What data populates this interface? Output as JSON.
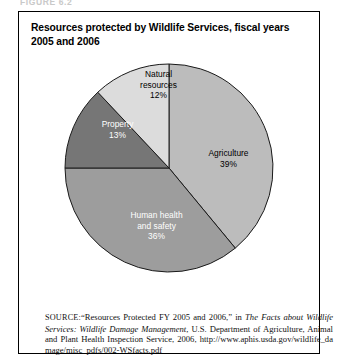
{
  "figure": {
    "number_label": "FIGURE 6.2",
    "title": "Resources protected by Wildlife Services, fiscal years 2005 and 2006"
  },
  "chart_data": {
    "type": "pie",
    "title": "Resources protected by Wildlife Services, fiscal years 2005 and 2006",
    "xlabel": "",
    "ylabel": "",
    "legend_position": "none",
    "grid": false,
    "labels_inside_slices": true,
    "start_angle_deg": 0,
    "direction": "clockwise",
    "categories": [
      "Agriculture",
      "Human health and safety",
      "Property",
      "Natural resources"
    ],
    "values": [
      39,
      36,
      13,
      12
    ],
    "unit": "%",
    "slices": [
      {
        "name": "Agriculture",
        "label_line1": "Agriculture",
        "label_line2": "39%",
        "value": 39,
        "color": "#bcbcbc",
        "text_color": "#000000"
      },
      {
        "name": "Human health and safety",
        "label_line1": "Human health",
        "label_line2": "and safety",
        "label_line3": "36%",
        "value": 36,
        "color": "#9d9d9d",
        "text_color": "#ffffff"
      },
      {
        "name": "Property",
        "label_line1": "Property",
        "label_line2": "13%",
        "value": 13,
        "color": "#767676",
        "text_color": "#ffffff"
      },
      {
        "name": "Natural resources",
        "label_line1": "Natural",
        "label_line2": "resources",
        "label_line3": "12%",
        "value": 12,
        "color": "#dcdcdc",
        "text_color": "#000000"
      }
    ]
  },
  "source": {
    "label": "SOURCE:",
    "text_part1": "“Resources Protected FY 2005 and 2006,” in ",
    "italic_part1": "The Facts about Wildlife Services: Wildlife Damage Management",
    "text_part2": ", U.S. Department of Agriculture, Animal and Plant Health Inspection Service, 2006, ",
    "url": "http://www.aphis.usda.gov/wildlife_damage/misc_pdfs/002-WSfacts.pdf"
  }
}
